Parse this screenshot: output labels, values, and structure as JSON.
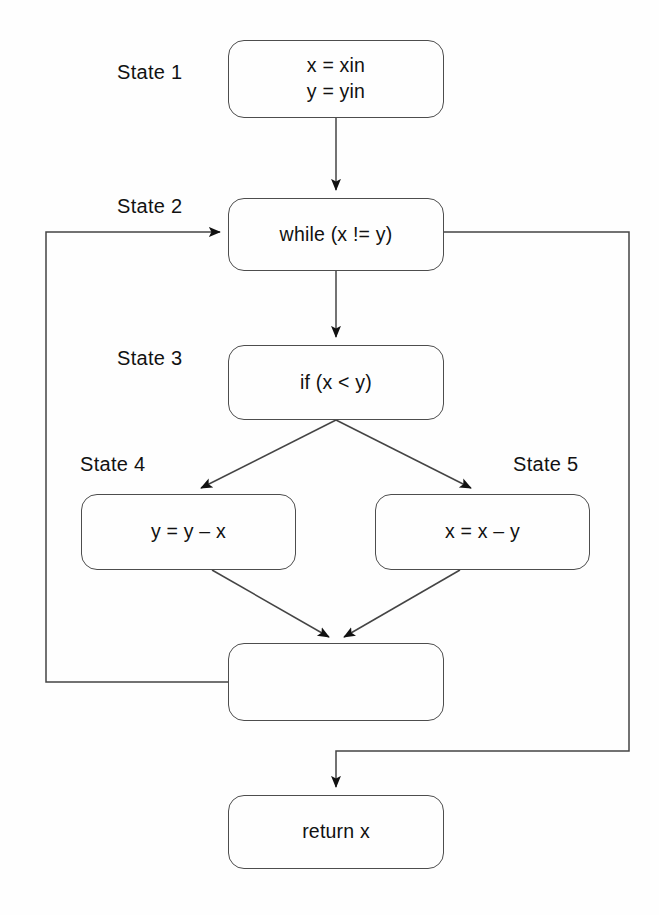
{
  "diagram": {
    "type": "flowchart",
    "background_color": "#fefefe",
    "stroke_color": "#4d4d4d",
    "text_color": "#111111",
    "nodes": [
      {
        "id": "state1",
        "state_label": "State 1",
        "lines": [
          "x = xin",
          "y = yin"
        ],
        "text": "x = xin\ny = yin"
      },
      {
        "id": "state2",
        "state_label": "State 2",
        "lines": [
          "while (x != y)"
        ],
        "text": "while (x != y)"
      },
      {
        "id": "state3",
        "state_label": "State 3",
        "lines": [
          "if (x < y)"
        ],
        "text": "if (x < y)"
      },
      {
        "id": "state4",
        "state_label": "State 4",
        "lines": [
          "y = y – x"
        ],
        "text": "y = y – x"
      },
      {
        "id": "state5",
        "state_label": "State 5",
        "lines": [
          "x = x – y"
        ],
        "text": "x = x – y"
      },
      {
        "id": "merge",
        "state_label": "",
        "lines": [
          ""
        ],
        "text": ""
      },
      {
        "id": "return",
        "state_label": "",
        "lines": [
          "return x"
        ],
        "text": "return x"
      }
    ],
    "edges": [
      {
        "from": "state1",
        "to": "state2",
        "kind": "straight-down"
      },
      {
        "from": "state2",
        "to": "state3",
        "kind": "straight-down"
      },
      {
        "from": "state3",
        "to": "state4",
        "kind": "branch-left"
      },
      {
        "from": "state3",
        "to": "state5",
        "kind": "branch-right"
      },
      {
        "from": "state4",
        "to": "merge",
        "kind": "merge-left"
      },
      {
        "from": "state5",
        "to": "merge",
        "kind": "merge-right"
      },
      {
        "from": "merge",
        "to": "state2",
        "kind": "loop-back-left"
      },
      {
        "from": "state2",
        "to": "return",
        "kind": "exit-right"
      }
    ]
  }
}
